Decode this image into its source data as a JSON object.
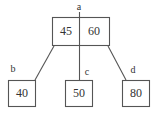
{
  "diagram": {
    "type": "b-tree",
    "title": "",
    "colors": {
      "background": "#ffffff",
      "stroke": "#555555",
      "text": "#333333"
    },
    "root": {
      "label": "a",
      "keys": [
        "45",
        "60"
      ]
    },
    "children": [
      {
        "label": "b",
        "keys": [
          "40"
        ]
      },
      {
        "label": "c",
        "keys": [
          "50"
        ]
      },
      {
        "label": "d",
        "keys": [
          "80"
        ]
      }
    ]
  }
}
